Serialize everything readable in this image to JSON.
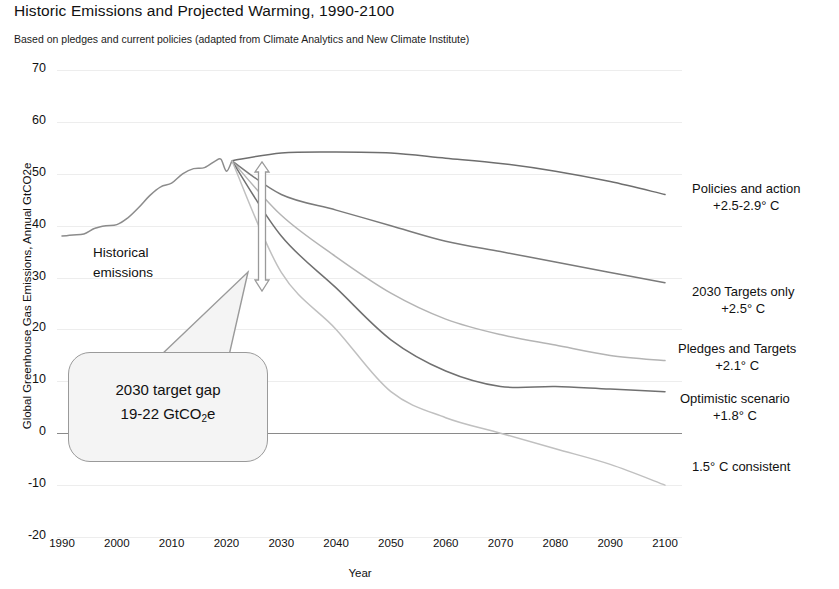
{
  "header": {
    "title": "Historic Emissions and Projected Warming, 1990-2100",
    "subtitle": "Based on pledges and current policies (adapted from Climate Analytics and New Climate Institute)"
  },
  "annotations": {
    "historical_line1": "Historical",
    "historical_line2": "emissions",
    "callout_line1": "2030 target gap",
    "callout_line2_pre": "19-22 GtCO",
    "callout_line2_sub": "2",
    "callout_line2_post": "e"
  },
  "scenario_labels": [
    {
      "name": "Policies and action",
      "warming": "+2.5-2.9° C"
    },
    {
      "name": "2030 Targets only",
      "warming": "+2.5° C"
    },
    {
      "name": "Pledges and Targets",
      "warming": "+2.1° C"
    },
    {
      "name": "Optimistic scenario",
      "warming": "+1.8° C"
    },
    {
      "name": "1.5° C consistent",
      "warming": ""
    }
  ],
  "chart_data": {
    "type": "line",
    "title": "Historic Emissions and Projected Warming, 1990-2100",
    "subtitle": "Based on pledges and current policies (adapted from Climate Analytics and New Climate Institute)",
    "xlabel": "Year",
    "ylabel": "Global Greenhouse Gas Emissions, Annual GtCO2e",
    "xlim": [
      1990,
      2100
    ],
    "ylim": [
      -20,
      70
    ],
    "xticks": [
      1990,
      2000,
      2010,
      2020,
      2030,
      2040,
      2050,
      2060,
      2070,
      2080,
      2090,
      2100
    ],
    "yticks": [
      70,
      60,
      50,
      40,
      30,
      20,
      10,
      0,
      -10,
      -20
    ],
    "grid": true,
    "legend_position": "right-inline-labels",
    "zero_line": 0,
    "gap_annotation": {
      "label": "2030 target gap",
      "value_range": "19-22 GtCO2e",
      "year": 2030,
      "from": 52,
      "to": 31
    },
    "series": [
      {
        "name": "Historical emissions",
        "color": "#8c8c8c",
        "x": [
          1990,
          1992,
          1994,
          1996,
          1998,
          2000,
          2002,
          2004,
          2006,
          2008,
          2010,
          2012,
          2014,
          2016,
          2018,
          2019,
          2020,
          2021
        ],
        "values": [
          38,
          38.2,
          38.4,
          39.5,
          40,
          40.2,
          41.5,
          43.5,
          45.8,
          47.5,
          48.2,
          50,
          51,
          51.2,
          52.5,
          52.8,
          50.5,
          52.5
        ]
      },
      {
        "name": "Policies and action",
        "warming": "+2.5-2.9° C",
        "color": "#6e6e6e",
        "x": [
          2021,
          2030,
          2040,
          2050,
          2060,
          2070,
          2080,
          2090,
          2100
        ],
        "values": [
          52.5,
          54,
          54.2,
          54,
          53,
          52,
          50.5,
          48.5,
          46
        ]
      },
      {
        "name": "2030 Targets only",
        "warming": "+2.5° C",
        "color": "#7a7a7a",
        "x": [
          2021,
          2030,
          2040,
          2050,
          2060,
          2070,
          2080,
          2090,
          2100
        ],
        "values": [
          52.5,
          46,
          43,
          40,
          37,
          35,
          33,
          31,
          29
        ]
      },
      {
        "name": "Pledges and Targets",
        "warming": "+2.1° C",
        "color": "#b4b4b4",
        "x": [
          2021,
          2030,
          2040,
          2050,
          2060,
          2070,
          2080,
          2090,
          2100
        ],
        "values": [
          52.5,
          42,
          34,
          27,
          22,
          19,
          17,
          15,
          14
        ]
      },
      {
        "name": "Optimistic scenario",
        "warming": "+1.8° C",
        "color": "#707070",
        "x": [
          2021,
          2030,
          2040,
          2050,
          2060,
          2070,
          2080,
          2090,
          2100
        ],
        "values": [
          52.5,
          38,
          28,
          18,
          12,
          9,
          9,
          8.5,
          8
        ]
      },
      {
        "name": "1.5° C consistent",
        "color": "#c0c0c0",
        "x": [
          2021,
          2030,
          2040,
          2050,
          2060,
          2070,
          2080,
          2090,
          2100
        ],
        "values": [
          52.5,
          31,
          20,
          8,
          3,
          0,
          -3,
          -6,
          -10
        ]
      }
    ]
  }
}
